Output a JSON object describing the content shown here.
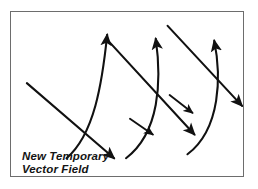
{
  "figure": {
    "caption_line1": "New Temporary",
    "caption_line2": "Vector Field",
    "border_color": "#6d6d6d",
    "ink_color": "#111111",
    "background_color": "#ffffff"
  },
  "diagram_data": {
    "type": "vector-field-sketch",
    "description": "Hand-drawn style vector field diagram: three parallel straight arrows directed down-right crossed by three curved arcs bowing to the right with arrowheads at their upper ends.",
    "straight_arrows": [
      {
        "name": "straight-arrow-1",
        "x1": 16,
        "y1": 72,
        "x2": 104,
        "y2": 148,
        "direction": "down-right",
        "arrowhead": "end"
      },
      {
        "name": "straight-arrow-2",
        "x1": 97,
        "y1": 28,
        "x2": 185,
        "y2": 124,
        "direction": "down-right",
        "arrowhead": "end"
      },
      {
        "name": "straight-arrow-3",
        "x1": 158,
        "y1": 14,
        "x2": 233,
        "y2": 95,
        "direction": "down-right",
        "arrowhead": "end"
      }
    ],
    "curved_arcs": [
      {
        "name": "curved-arc-1",
        "start": [
          56,
          148
        ],
        "control": [
          86,
          70
        ],
        "end": [
          97,
          22
        ],
        "bow": "right",
        "arrowhead": "end-up-right"
      },
      {
        "name": "curved-arc-2",
        "start": [
          116,
          148
        ],
        "control": [
          150,
          68
        ],
        "end": [
          145,
          26
        ],
        "bow": "right",
        "arrowhead": "end-up-right",
        "mid_arrowhead": [
          143,
          122
        ]
      },
      {
        "name": "curved-arc-3",
        "start": [
          178,
          144
        ],
        "control": [
          212,
          62
        ],
        "end": [
          205,
          28
        ],
        "bow": "right",
        "arrowhead": "end-up-right",
        "mid_arrowhead": [
          183,
          100
        ]
      }
    ]
  }
}
